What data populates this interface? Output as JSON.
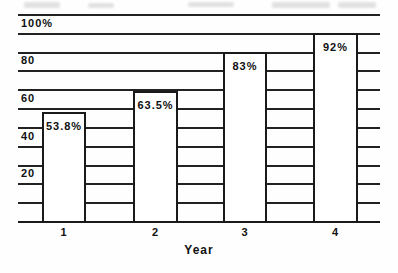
{
  "chart_data": {
    "type": "bar",
    "title": "",
    "xlabel": "Year",
    "ylabel": "",
    "categories": [
      "1",
      "2",
      "3",
      "4"
    ],
    "values": [
      53.8,
      63.5,
      83,
      92
    ],
    "bar_labels": [
      "53.8%",
      "63.5%",
      "83%",
      "92%"
    ],
    "ytick_values": [
      20,
      40,
      60,
      80,
      100
    ],
    "ytick_labels": [
      "20",
      "40",
      "60",
      "80",
      "100%"
    ],
    "ylim": [
      0,
      110
    ],
    "gridline_step": 10,
    "grid": "horizontal",
    "legend": "none",
    "bar_fill": "#ffffff",
    "line_color": "#222222",
    "text_color": "#111111",
    "background": "#fefefe",
    "rendered_bar_top_pct": [
      58.5,
      69.8,
      90.3,
      100.4
    ]
  }
}
